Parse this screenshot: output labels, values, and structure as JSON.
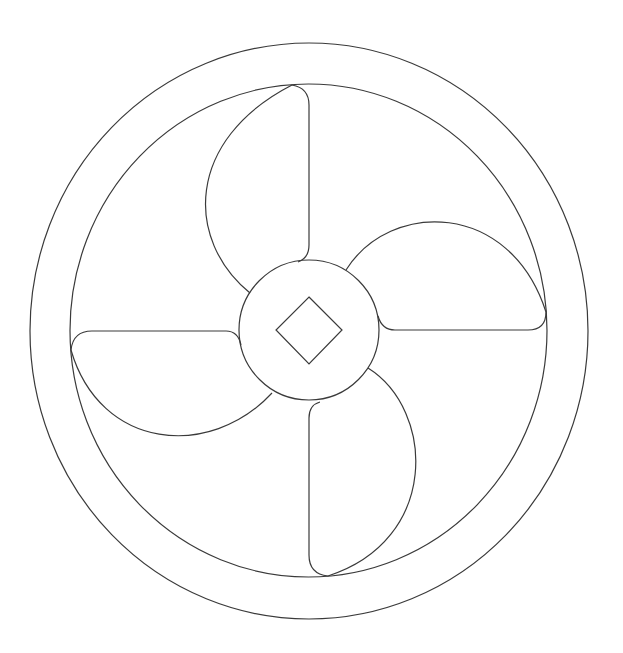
{
  "diagram": {
    "title": "Fan propeller line drawing",
    "stroke_color": "#3a3a3a",
    "background_color": "#ffffff",
    "parts": {
      "outer_ring": "outer-ring",
      "inner_ring": "inner-ring",
      "hub": "hub",
      "shaft_key": "square-shaft-key",
      "blades": [
        "blade-top",
        "blade-right",
        "blade-bottom",
        "blade-left"
      ]
    },
    "blade_count": 4
  }
}
